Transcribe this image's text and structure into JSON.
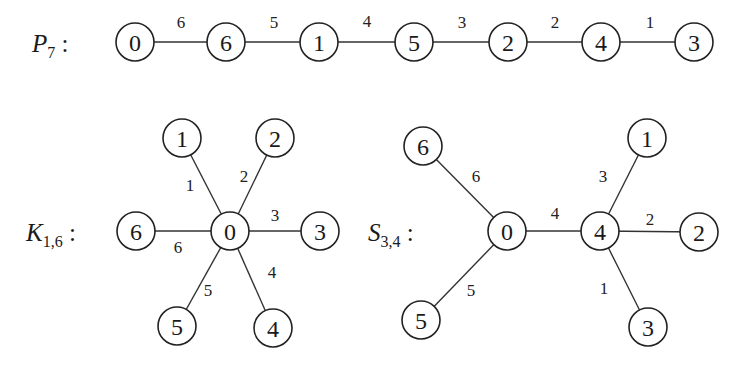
{
  "graphs": [
    {
      "id": "P7",
      "title": {
        "main": "P",
        "sub": "7",
        "colon": " :"
      },
      "title_pos": [
        32,
        52
      ],
      "nodes": [
        {
          "label": "0",
          "x": 135,
          "y": 42
        },
        {
          "label": "6",
          "x": 226,
          "y": 42
        },
        {
          "label": "1",
          "x": 319,
          "y": 42
        },
        {
          "label": "5",
          "x": 414,
          "y": 42
        },
        {
          "label": "2",
          "x": 508,
          "y": 42
        },
        {
          "label": "4",
          "x": 601,
          "y": 42
        },
        {
          "label": "3",
          "x": 694,
          "y": 42
        }
      ],
      "edges": [
        {
          "from": 0,
          "to": 1,
          "label": "6",
          "lx": 181,
          "ly": 22
        },
        {
          "from": 1,
          "to": 2,
          "label": "5",
          "lx": 274,
          "ly": 22
        },
        {
          "from": 2,
          "to": 3,
          "label": "4",
          "lx": 367,
          "ly": 21
        },
        {
          "from": 3,
          "to": 4,
          "label": "3",
          "lx": 462,
          "ly": 22
        },
        {
          "from": 4,
          "to": 5,
          "label": "2",
          "lx": 555,
          "ly": 22
        },
        {
          "from": 5,
          "to": 6,
          "label": "1",
          "lx": 650,
          "ly": 22
        }
      ]
    },
    {
      "id": "K16",
      "title": {
        "main": "K",
        "sub": "1,6",
        "colon": " :"
      },
      "title_pos": [
        26,
        241
      ],
      "nodes": [
        {
          "label": "0",
          "x": 230,
          "y": 231
        },
        {
          "label": "1",
          "x": 182,
          "y": 138
        },
        {
          "label": "2",
          "x": 275,
          "y": 138
        },
        {
          "label": "3",
          "x": 320,
          "y": 231
        },
        {
          "label": "4",
          "x": 273,
          "y": 328
        },
        {
          "label": "5",
          "x": 177,
          "y": 326
        },
        {
          "label": "6",
          "x": 136,
          "y": 231
        }
      ],
      "edges": [
        {
          "from": 0,
          "to": 1,
          "label": "1",
          "lx": 190,
          "ly": 185
        },
        {
          "from": 0,
          "to": 2,
          "label": "2",
          "lx": 244,
          "ly": 176
        },
        {
          "from": 0,
          "to": 3,
          "label": "3",
          "lx": 275,
          "ly": 215
        },
        {
          "from": 0,
          "to": 4,
          "label": "4",
          "lx": 272,
          "ly": 272
        },
        {
          "from": 0,
          "to": 5,
          "label": "5",
          "lx": 208,
          "ly": 290
        },
        {
          "from": 0,
          "to": 6,
          "label": "6",
          "lx": 178,
          "ly": 247
        }
      ]
    },
    {
      "id": "S34",
      "title": {
        "main": "S",
        "sub": "3,4",
        "colon": " :"
      },
      "title_pos": [
        368,
        241
      ],
      "nodes": [
        {
          "label": "0",
          "x": 507,
          "y": 231
        },
        {
          "label": "4",
          "x": 600,
          "y": 231
        },
        {
          "label": "6",
          "x": 423,
          "y": 146
        },
        {
          "label": "5",
          "x": 421,
          "y": 320
        },
        {
          "label": "1",
          "x": 647,
          "y": 138
        },
        {
          "label": "2",
          "x": 699,
          "y": 232
        },
        {
          "label": "3",
          "x": 648,
          "y": 327
        }
      ],
      "edges": [
        {
          "from": 0,
          "to": 1,
          "label": "4",
          "lx": 555,
          "ly": 213
        },
        {
          "from": 0,
          "to": 2,
          "label": "6",
          "lx": 476,
          "ly": 176
        },
        {
          "from": 0,
          "to": 3,
          "label": "5",
          "lx": 471,
          "ly": 290
        },
        {
          "from": 1,
          "to": 4,
          "label": "3",
          "lx": 603,
          "ly": 176
        },
        {
          "from": 1,
          "to": 5,
          "label": "2",
          "lx": 650,
          "ly": 219
        },
        {
          "from": 1,
          "to": 6,
          "label": "1",
          "lx": 604,
          "ly": 288
        }
      ]
    }
  ],
  "style": {
    "node_radius": 19,
    "stroke_color": "#222222",
    "background": "#ffffff"
  }
}
